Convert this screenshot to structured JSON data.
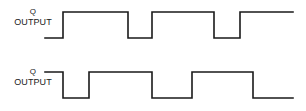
{
  "figure": {
    "kind": "timing-diagram",
    "background_color": "#ffffff",
    "trace_color": "#1a1a1a",
    "trace_width": 1.6
  },
  "signals": [
    {
      "id": "q",
      "name": "Q",
      "overline": false,
      "sub_label": "OUTPUT",
      "high_y": 12,
      "low_y": 38,
      "x_start": 45,
      "x_end": 293,
      "initial_level": "low",
      "transitions": [
        {
          "x": 63,
          "to": "high"
        },
        {
          "x": 128,
          "to": "low"
        },
        {
          "x": 152,
          "to": "high"
        },
        {
          "x": 214,
          "to": "low"
        },
        {
          "x": 240,
          "to": "high"
        }
      ],
      "final_level": "high"
    },
    {
      "id": "qbar",
      "name": "Q",
      "overline": true,
      "sub_label": "OUTPUT",
      "high_y": 72,
      "low_y": 98,
      "x_start": 45,
      "x_end": 293,
      "initial_level": "high",
      "transitions": [
        {
          "x": 63,
          "to": "low"
        },
        {
          "x": 89,
          "to": "high"
        },
        {
          "x": 152,
          "to": "low"
        },
        {
          "x": 192,
          "to": "high"
        },
        {
          "x": 253,
          "to": "low"
        }
      ],
      "final_level": "low"
    }
  ]
}
